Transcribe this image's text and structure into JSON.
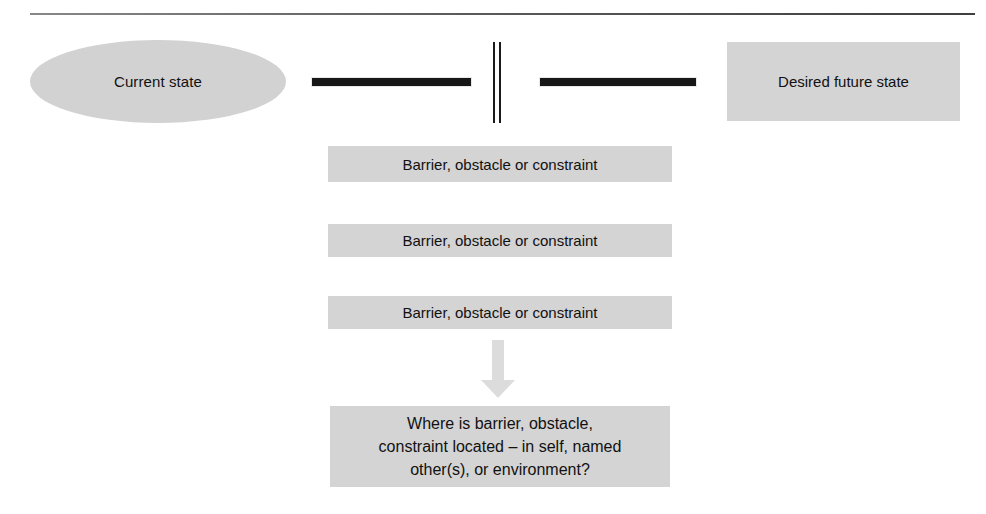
{
  "diagram": {
    "current_state": {
      "label": "Current state",
      "shape": "ellipse",
      "fill": "#d2d2d2"
    },
    "future_state": {
      "label": "Desired future state",
      "shape": "rectangle",
      "fill": "#d4d4d4"
    },
    "divider": {
      "name": "vertical-double-bar",
      "color": "#1a1a1a"
    },
    "connectors": [
      {
        "name": "left-bar",
        "color": "#171717"
      },
      {
        "name": "right-bar",
        "color": "#171717"
      }
    ],
    "barriers": [
      {
        "label": "Barrier, obstacle or constraint"
      },
      {
        "label": "Barrier, obstacle or constraint"
      },
      {
        "label": "Barrier, obstacle or constraint"
      }
    ],
    "arrow": {
      "name": "down-arrow",
      "direction": "down",
      "fill": "#dcdcdc"
    },
    "question": {
      "lines": [
        "Where is barrier, obstacle,",
        "constraint located – in self, named",
        "other(s), or environment?"
      ],
      "fill": "#d4d4d4"
    }
  }
}
